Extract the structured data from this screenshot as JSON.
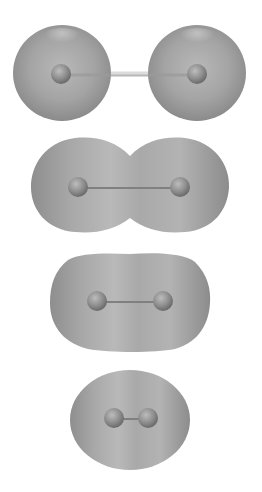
{
  "diagram": {
    "colors": {
      "background": "#ffffff",
      "cloud_dark": "#8a8a8a",
      "cloud_mid": "#a6a6a6",
      "cloud_light": "#c4c4c4",
      "nucleus_dark": "#6f6f6f",
      "nucleus_light": "#b5b5b5",
      "bond": "#7d7d7d"
    },
    "stages": [
      {
        "id": "separated",
        "shape": "two-spheres",
        "nucleus_left": [
          61,
          74
        ],
        "nucleus_right": [
          197,
          74
        ]
      },
      {
        "id": "overlapping",
        "shape": "peanut",
        "nucleus_left": [
          78,
          187
        ],
        "nucleus_right": [
          180,
          187
        ]
      },
      {
        "id": "merged",
        "shape": "capsule",
        "nucleus_left": [
          97,
          301
        ],
        "nucleus_right": [
          163,
          301
        ]
      },
      {
        "id": "close",
        "shape": "ellipse",
        "nucleus_left": [
          115,
          418
        ],
        "nucleus_right": [
          148,
          418
        ]
      }
    ]
  }
}
